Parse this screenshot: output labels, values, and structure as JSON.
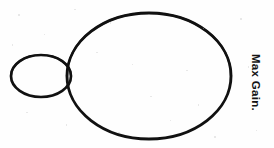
{
  "figure": {
    "title": "Max Gain.",
    "background_color": "#fefefe",
    "stroke_color": "#111111",
    "annotations": [
      {
        "id": "max-gain-label",
        "text": "Max Gain.",
        "rotation_degrees": 90,
        "font_weight": "bold",
        "color": "#141414"
      }
    ],
    "shapes": [
      {
        "id": "main-lobe-ellipse",
        "name": "large-ellipse",
        "cx": 149,
        "cy": 76,
        "rx": 82,
        "ry": 63,
        "stroke_width": 2.9,
        "fill": "none"
      },
      {
        "id": "back-lobe-ellipse",
        "name": "small-ellipse",
        "cx": 41,
        "cy": 76,
        "rx": 30,
        "ry": 21,
        "stroke_width": 2.7,
        "fill": "none"
      }
    ]
  },
  "chart_data": {
    "type": "scatter",
    "title": "Max Gain.",
    "xlabel": "",
    "ylabel": "",
    "grid": false,
    "legend_position": "right",
    "xlim": [
      0,
      274
    ],
    "ylim": [
      0,
      148
    ],
    "annotations": [
      "Max Gain."
    ],
    "series": [
      {
        "name": "large-ellipse",
        "shape": "ellipse",
        "center": [
          149,
          76
        ],
        "radii": [
          82,
          63
        ]
      },
      {
        "name": "small-ellipse",
        "shape": "ellipse",
        "center": [
          41,
          76
        ],
        "radii": [
          30,
          21
        ]
      }
    ]
  }
}
